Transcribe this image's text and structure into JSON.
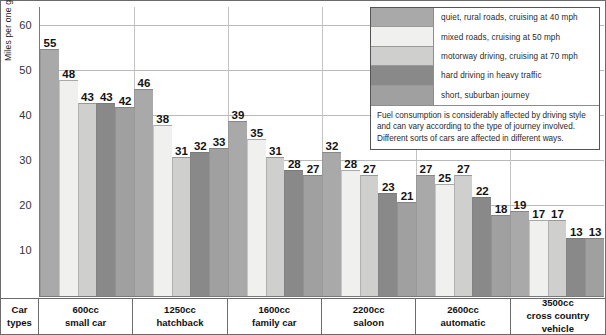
{
  "chart_data": {
    "type": "bar",
    "title": "",
    "xlabel": "Car types",
    "ylabel": "Miles per one gallon of petrol",
    "ylim": [
      0,
      65
    ],
    "yticks": [
      10,
      20,
      30,
      40,
      50,
      60
    ],
    "grid": true,
    "legend_position": "top-right",
    "categories": [
      {
        "line1": "600cc",
        "line2": "small car"
      },
      {
        "line1": "1250cc",
        "line2": "hatchback"
      },
      {
        "line1": "1600cc",
        "line2": "family car"
      },
      {
        "line1": "2200cc",
        "line2": "saloon"
      },
      {
        "line1": "2600cc",
        "line2": "automatic"
      },
      {
        "line1": "3500cc",
        "line2": "cross country vehicle"
      }
    ],
    "category_labels": [
      "600cc small car",
      "1250cc hatchback",
      "1600cc family car",
      "2200cc saloon",
      "2600cc automatic",
      "3500cc cross country vehicle"
    ],
    "series": [
      {
        "name": "quiet, rural roads, cruising at 40 mph",
        "color": "#a9a9a9",
        "values": [
          55,
          46,
          39,
          32,
          27,
          19
        ]
      },
      {
        "name": "mixed roads, cruising at 50 mph",
        "color": "#f0f0ee",
        "values": [
          48,
          38,
          35,
          28,
          25,
          17
        ]
      },
      {
        "name": "motorway driving, cruising at 70 mph",
        "color": "#cfcfcd",
        "values": [
          43,
          31,
          31,
          27,
          27,
          17
        ]
      },
      {
        "name": "hard driving in heavy traffic",
        "color": "#898989",
        "values": [
          43,
          32,
          28,
          23,
          22,
          13
        ]
      },
      {
        "name": "short, suburban journey",
        "color": "#a0a0a0",
        "values": [
          42,
          33,
          27,
          21,
          18,
          13
        ]
      }
    ],
    "note": "Fuel consumption is considerably affected by driving style and can vary according to the type of journey involved. Different sorts of cars are affected in different ways."
  },
  "footer": {
    "axis_title_line1": "Car",
    "axis_title_line2": "types"
  }
}
